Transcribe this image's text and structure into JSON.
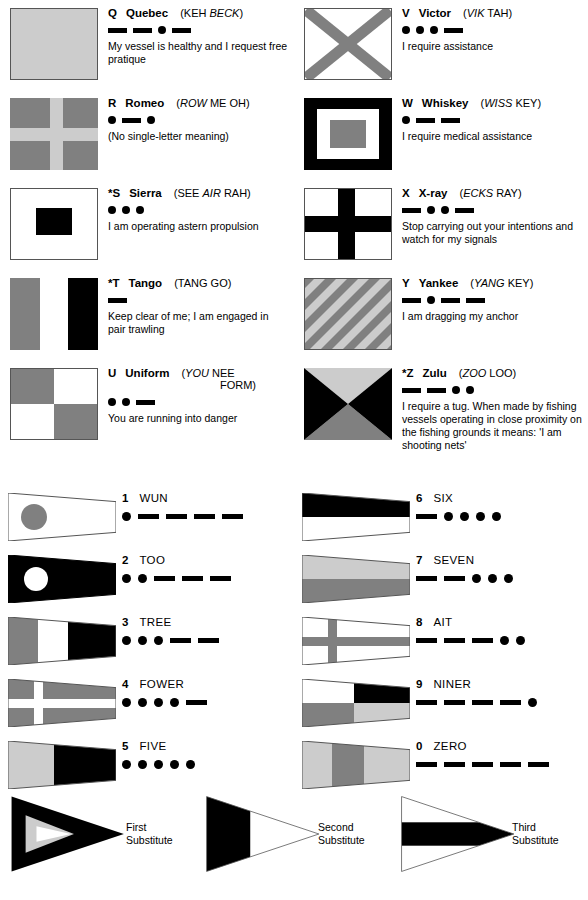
{
  "letter_flags": [
    {
      "letter": "Q",
      "prefix": "",
      "name": "Quebec",
      "pron_pre": "(KEH ",
      "pron_em": "BECK",
      "pron_post": ")",
      "pron_line2": "",
      "morse": [
        "dash",
        "dash",
        "dot",
        "dash"
      ],
      "meaning": "My vessel is healthy and I request free pratique",
      "flag": "Q"
    },
    {
      "letter": "R",
      "prefix": "",
      "name": "Romeo",
      "pron_pre": "(",
      "pron_em": "ROW",
      "pron_post": " ME OH)",
      "pron_line2": "",
      "morse": [
        "dot",
        "dash",
        "dot"
      ],
      "meaning": "(No single-letter meaning)",
      "flag": "R"
    },
    {
      "letter": "S",
      "prefix": "*",
      "name": "Sierra",
      "pron_pre": "(SEE ",
      "pron_em": "AIR",
      "pron_post": " RAH)",
      "pron_line2": "",
      "morse": [
        "dot",
        "dot",
        "dot"
      ],
      "meaning": "I am operating astern propulsion",
      "flag": "S"
    },
    {
      "letter": "T",
      "prefix": "*",
      "name": "Tango",
      "pron_pre": "(TANG GO)",
      "pron_em": "",
      "pron_post": "",
      "pron_line2": "",
      "morse": [
        "dash"
      ],
      "meaning": "Keep clear of me; I am engaged in pair trawling",
      "flag": "T"
    },
    {
      "letter": "U",
      "prefix": "",
      "name": "Uniform",
      "pron_pre": "(",
      "pron_em": "YOU",
      "pron_post": " NEE",
      "pron_line2": "FORM)",
      "morse": [
        "dot",
        "dot",
        "dash"
      ],
      "meaning": "You are running into danger",
      "flag": "U"
    },
    {
      "letter": "V",
      "prefix": "",
      "name": "Victor",
      "pron_pre": "(",
      "pron_em": "VIK",
      "pron_post": " TAH)",
      "pron_line2": "",
      "morse": [
        "dot",
        "dot",
        "dot",
        "dash"
      ],
      "meaning": "I require assistance",
      "flag": "V"
    },
    {
      "letter": "W",
      "prefix": "",
      "name": "Whiskey",
      "pron_pre": "(",
      "pron_em": "WISS",
      "pron_post": " KEY)",
      "pron_line2": "",
      "morse": [
        "dot",
        "dash",
        "dash"
      ],
      "meaning": "I require medical assistance",
      "flag": "W"
    },
    {
      "letter": "X",
      "prefix": "",
      "name": "X-ray",
      "pron_pre": "(",
      "pron_em": "ECKS",
      "pron_post": " RAY)",
      "pron_line2": "",
      "morse": [
        "dash",
        "dot",
        "dot",
        "dash"
      ],
      "meaning": "Stop carrying out your intentions and watch for my signals",
      "flag": "X"
    },
    {
      "letter": "Y",
      "prefix": "",
      "name": "Yankee",
      "pron_pre": "(",
      "pron_em": "YANG",
      "pron_post": " KEY)",
      "pron_line2": "",
      "morse": [
        "dash",
        "dot",
        "dash",
        "dash"
      ],
      "meaning": "I am dragging my anchor",
      "flag": "Y"
    },
    {
      "letter": "Z",
      "prefix": "*",
      "name": "Zulu",
      "pron_pre": "(",
      "pron_em": "ZOO",
      "pron_post": " LOO)",
      "pron_line2": "",
      "morse": [
        "dash",
        "dash",
        "dot",
        "dot"
      ],
      "meaning": "I require a tug. When made by fishing vessels operating in close proximity on the fishing grounds it means: 'I am shooting nets'",
      "flag": "Z"
    }
  ],
  "numeral_pennants": [
    {
      "num": "1",
      "word": "WUN",
      "morse": [
        "dot",
        "dash",
        "dash",
        "dash",
        "dash"
      ],
      "flag": "N1"
    },
    {
      "num": "2",
      "word": "TOO",
      "morse": [
        "dot",
        "dot",
        "dash",
        "dash",
        "dash"
      ],
      "flag": "N2"
    },
    {
      "num": "3",
      "word": "TREE",
      "morse": [
        "dot",
        "dot",
        "dot",
        "dash",
        "dash"
      ],
      "flag": "N3"
    },
    {
      "num": "4",
      "word": "FOWER",
      "morse": [
        "dot",
        "dot",
        "dot",
        "dot",
        "dash"
      ],
      "flag": "N4"
    },
    {
      "num": "5",
      "word": "FIVE",
      "morse": [
        "dot",
        "dot",
        "dot",
        "dot",
        "dot"
      ],
      "flag": "N5"
    },
    {
      "num": "6",
      "word": "SIX",
      "morse": [
        "dash",
        "dot",
        "dot",
        "dot",
        "dot"
      ],
      "flag": "N6"
    },
    {
      "num": "7",
      "word": "SEVEN",
      "morse": [
        "dash",
        "dash",
        "dot",
        "dot",
        "dot"
      ],
      "flag": "N7"
    },
    {
      "num": "8",
      "word": "AIT",
      "morse": [
        "dash",
        "dash",
        "dash",
        "dot",
        "dot"
      ],
      "flag": "N8"
    },
    {
      "num": "9",
      "word": "NINER",
      "morse": [
        "dash",
        "dash",
        "dash",
        "dash",
        "dot"
      ],
      "flag": "N9"
    },
    {
      "num": "0",
      "word": "ZERO",
      "morse": [
        "dash",
        "dash",
        "dash",
        "dash",
        "dash"
      ],
      "flag": "N0"
    }
  ],
  "substitutes": [
    {
      "label_line1": "First",
      "label_line2": "Substitute",
      "flag": "SUB1"
    },
    {
      "label_line1": "Second",
      "label_line2": "Substitute",
      "flag": "SUB2"
    },
    {
      "label_line1": "Third",
      "label_line2": "Substitute",
      "flag": "SUB3"
    }
  ],
  "colors": {
    "ink": "#000000",
    "red_gray": "#808080",
    "yellow_gray": "#cccccc",
    "blue_black": "#1a1a1a",
    "white": "#ffffff",
    "outline": "#555555"
  }
}
